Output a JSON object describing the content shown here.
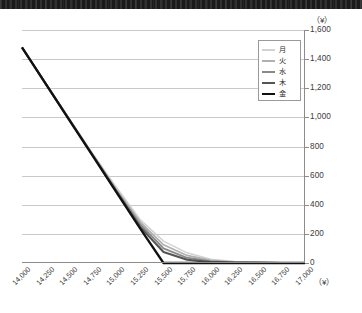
{
  "chart_data": {
    "type": "line",
    "title": "",
    "subtitle": "",
    "xlabel": "",
    "ylabel": "",
    "x_unit_label": "（¥）",
    "y_unit_label": "（¥）",
    "grid": true,
    "legend_position": "top-right",
    "xlim": [
      14000,
      17000
    ],
    "ylim": [
      0,
      1600
    ],
    "x_tick_step": 250,
    "y_tick_step": 200,
    "categories": [
      "14,000",
      "14,250",
      "14,500",
      "14,750",
      "15,000",
      "15,250",
      "15,500",
      "15,750",
      "16,000",
      "16,250",
      "16,500",
      "16,750",
      "17,000"
    ],
    "x": [
      14000,
      14250,
      14500,
      14750,
      15000,
      15250,
      15500,
      15750,
      16000,
      16250,
      16500,
      16750,
      17000
    ],
    "ytick_labels": [
      "1,600",
      "1,400",
      "1,200",
      "1,000",
      "800",
      "600",
      "400",
      "200",
      "0"
    ],
    "ytick_values": [
      1600,
      1400,
      1200,
      1000,
      800,
      600,
      400,
      200,
      0
    ],
    "series": [
      {
        "name": "月",
        "color": "#d2d2d2",
        "width": 1.5,
        "values": [
          1480,
          1235,
          990,
          750,
          520,
          300,
          150,
          70,
          26,
          10,
          5,
          2,
          0
        ]
      },
      {
        "name": "火",
        "color": "#b0b0b0",
        "width": 1.7,
        "values": [
          1480,
          1235,
          990,
          745,
          505,
          285,
          125,
          52,
          18,
          7,
          3,
          1,
          0
        ]
      },
      {
        "name": "水",
        "color": "#8a8a8a",
        "width": 1.9,
        "values": [
          1480,
          1233,
          987,
          742,
          498,
          268,
          100,
          36,
          11,
          4,
          2,
          1,
          0
        ]
      },
      {
        "name": "木",
        "color": "#545454",
        "width": 2.1,
        "values": [
          1480,
          1232,
          985,
          738,
          492,
          250,
          75,
          22,
          6,
          2,
          1,
          0,
          0
        ]
      },
      {
        "name": "金",
        "color": "#111111",
        "width": 2.3,
        "values": [
          1480,
          1231,
          983,
          735,
          487,
          240,
          0,
          0,
          0,
          0,
          0,
          0,
          0
        ]
      }
    ]
  },
  "legend": {
    "items": [
      {
        "label": "月"
      },
      {
        "label": "火"
      },
      {
        "label": "水"
      },
      {
        "label": "木"
      },
      {
        "label": "金"
      }
    ]
  }
}
